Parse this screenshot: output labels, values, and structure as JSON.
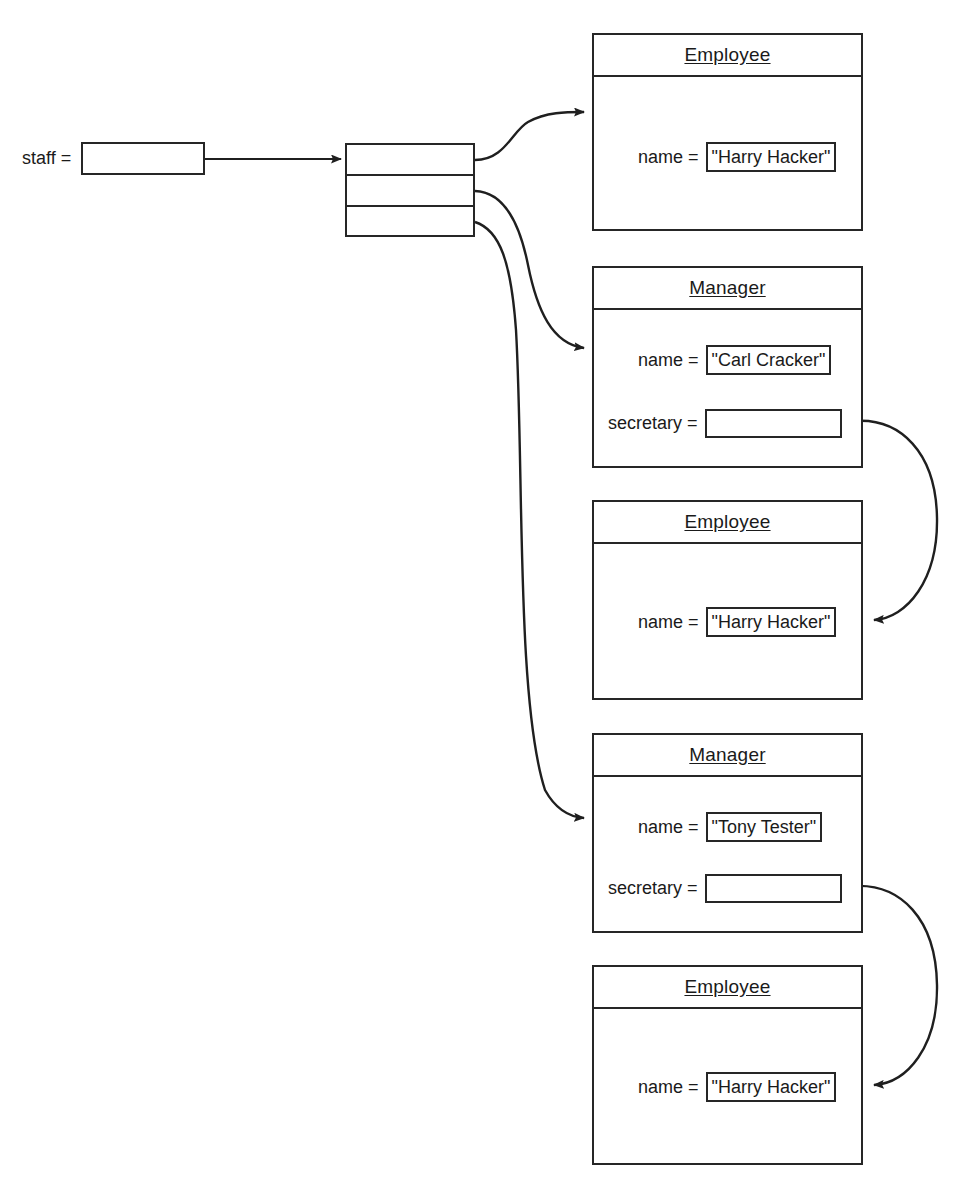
{
  "diagram": {
    "kind": "object-reference-diagram",
    "variable": {
      "name": "staff =",
      "slot_icon": "pointer-slot-icon"
    },
    "array": {
      "name": "staff-array",
      "cell_count": 3,
      "cells": [
        {
          "index": 0,
          "points_to": "Employee \"Harry Hacker\""
        },
        {
          "index": 1,
          "points_to": "Manager \"Carl Cracker\""
        },
        {
          "index": 2,
          "points_to": "Manager \"Tony Tester\""
        }
      ]
    },
    "objects": [
      {
        "id": "employee-1",
        "title": "Employee",
        "fields": [
          {
            "label": "name =",
            "kind": "value",
            "value": "\"Harry Hacker\""
          }
        ]
      },
      {
        "id": "manager-1",
        "title": "Manager",
        "fields": [
          {
            "label": "name =",
            "kind": "value",
            "value": "\"Carl Cracker\""
          },
          {
            "label": "secretary =",
            "kind": "reference",
            "value": ""
          }
        ]
      },
      {
        "id": "employee-2",
        "title": "Employee",
        "fields": [
          {
            "label": "name =",
            "kind": "value",
            "value": "\"Harry Hacker\""
          }
        ]
      },
      {
        "id": "manager-2",
        "title": "Manager",
        "fields": [
          {
            "label": "name =",
            "kind": "value",
            "value": "\"Tony Tester\""
          },
          {
            "label": "secretary =",
            "kind": "reference",
            "value": ""
          }
        ]
      },
      {
        "id": "employee-3",
        "title": "Employee",
        "fields": [
          {
            "label": "name =",
            "kind": "value",
            "value": "\"Harry Hacker\""
          }
        ]
      }
    ],
    "arrows": [
      {
        "name": "staff-to-array",
        "from": "staff variable slot",
        "to": "array object"
      },
      {
        "name": "array0-to-employee1",
        "from": "array cell 0",
        "to": "Employee \"Harry Hacker\""
      },
      {
        "name": "array1-to-manager1",
        "from": "array cell 1",
        "to": "Manager \"Carl Cracker\""
      },
      {
        "name": "array2-to-manager2",
        "from": "array cell 2",
        "to": "Manager \"Tony Tester\""
      },
      {
        "name": "manager1-secretary-to-employee2",
        "from": "Carl Cracker secretary",
        "to": "Employee \"Harry Hacker\""
      },
      {
        "name": "manager2-secretary-to-employee3",
        "from": "Tony Tester secretary",
        "to": "Employee \"Harry Hacker\""
      }
    ],
    "colors": {
      "stroke": "#262626",
      "text": "#1a1a1a",
      "background": "#ffffff"
    }
  }
}
